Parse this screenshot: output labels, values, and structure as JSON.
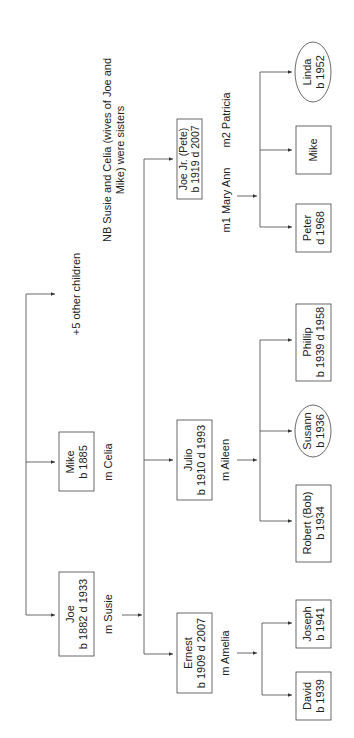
{
  "note": {
    "line1": "NB Susie and Celia (wives of Joe and",
    "line2": "Mike) were sisters"
  },
  "generation1": [
    {
      "name": "Joe",
      "dates": "b 1882 d 1933",
      "spouse": "m Susie"
    },
    {
      "name": "Mike",
      "dates": "b 1885",
      "spouse": "m Celia"
    },
    {
      "other": "+5 other children"
    }
  ],
  "generation2": [
    {
      "name": "Ernest",
      "dates": "b 1909 d 2007",
      "spouse": "m Amelia"
    },
    {
      "name": "Julio",
      "dates": "b 1910 d 1993",
      "spouse": "m Aileen"
    },
    {
      "name": "Joe Jr. (Pete)",
      "dates": "b 1919 d 2007",
      "spouse1": "m1 Mary Ann",
      "spouse2": "m2 Patricia"
    }
  ],
  "generation3": {
    "ernest_children": [
      {
        "name": "David",
        "dates": "b 1939",
        "shape": "box"
      },
      {
        "name": "Joseph",
        "dates": "b 1941",
        "shape": "box"
      }
    ],
    "julio_children": [
      {
        "name": "Robert (Bob)",
        "dates": "b 1934",
        "shape": "box"
      },
      {
        "name": "Susann",
        "dates": "b 1936",
        "shape": "ellipse"
      },
      {
        "name": "Phillip",
        "dates": "b 1939 d 1958",
        "shape": "box"
      }
    ],
    "joejr_children": [
      {
        "name": "Peter",
        "dates": "d 1968",
        "shape": "box"
      },
      {
        "name": "Mike",
        "dates": "",
        "shape": "box"
      },
      {
        "name": "Linda",
        "dates": "b 1952",
        "shape": "ellipse"
      }
    ]
  }
}
